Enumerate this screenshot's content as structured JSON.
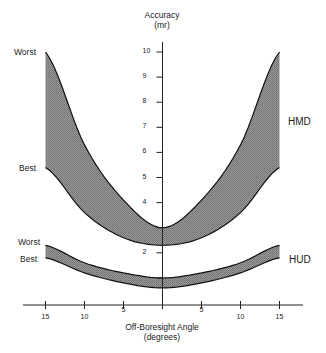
{
  "chart_data": {
    "type": "area",
    "title": "",
    "xlabel": "Off-Boresight Angle (degrees)",
    "ylabel": "Accuracy (mr)",
    "xlim": [
      -15,
      15
    ],
    "ylim": [
      0,
      10
    ],
    "x_tick_labels": [
      "15",
      "10",
      "5",
      "",
      "5",
      "10",
      "15"
    ],
    "y_tick_labels": [
      "2",
      "4",
      "5",
      "6",
      "7",
      "8",
      "9",
      "10"
    ],
    "x": [
      -15,
      -10,
      -5,
      0,
      5,
      10,
      15
    ],
    "series": [
      {
        "name": "HMD Worst",
        "values": [
          10.0,
          6.3,
          4.1,
          3.0,
          4.1,
          6.3,
          10.0
        ]
      },
      {
        "name": "HMD Best",
        "values": [
          5.4,
          3.6,
          2.6,
          2.3,
          2.6,
          3.6,
          5.4
        ]
      },
      {
        "name": "HUD Worst",
        "values": [
          2.3,
          1.6,
          1.2,
          1.0,
          1.2,
          1.6,
          2.3
        ]
      },
      {
        "name": "HUD Best",
        "values": [
          1.8,
          1.2,
          0.8,
          0.6,
          0.8,
          1.2,
          1.8
        ]
      }
    ],
    "bands": [
      {
        "name": "HMD",
        "upper": "HMD Worst",
        "lower": "HMD Best"
      },
      {
        "name": "HUD",
        "upper": "HUD Worst",
        "lower": "HUD Best"
      }
    ],
    "annotations": [
      "Worst",
      "Best",
      "Worst",
      "Best",
      "HMD",
      "HUD"
    ],
    "grid": false
  },
  "labels": {
    "y_title_1": "Accuracy",
    "y_title_2": "(mr)",
    "x_title_1": "Off-Boresight Angle",
    "x_title_2": "(degrees)",
    "hmd": "HMD",
    "hud": "HUD",
    "hmd_worst": "Worst",
    "hmd_best": "Best",
    "hud_worst": "Worst",
    "hud_best": "Best"
  },
  "ticks": {
    "y": [
      "10",
      "9",
      "8",
      "7",
      "6",
      "5",
      "4",
      "2"
    ],
    "x": [
      "15",
      "10",
      "5",
      "5",
      "10",
      "15"
    ]
  }
}
